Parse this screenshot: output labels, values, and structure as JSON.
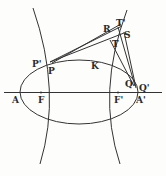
{
  "diagram": {
    "stroke_color": "#333333",
    "labels": {
      "A": "A",
      "F": "F",
      "F_prime": "F'",
      "A_prime": "A'",
      "P": "P",
      "P_prime": "P'",
      "K": "K",
      "Q": "Q",
      "Q_prime": "Q'",
      "R": "R",
      "S": "S",
      "T": "T",
      "T_prime": "T'"
    }
  }
}
